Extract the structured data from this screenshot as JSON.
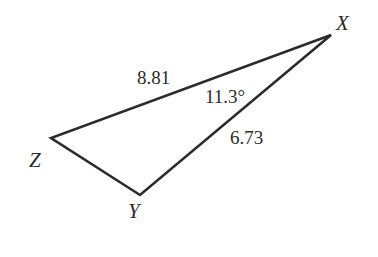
{
  "diagram": {
    "type": "triangle",
    "stroke_color": "#2b2b2b",
    "vertices": [
      {
        "name": "X",
        "label": "X"
      },
      {
        "name": "Y",
        "label": "Y"
      },
      {
        "name": "Z",
        "label": "Z"
      }
    ],
    "sides": {
      "XZ": "8.81",
      "XY": "6.73"
    },
    "angles": {
      "X": "11.3°"
    }
  }
}
